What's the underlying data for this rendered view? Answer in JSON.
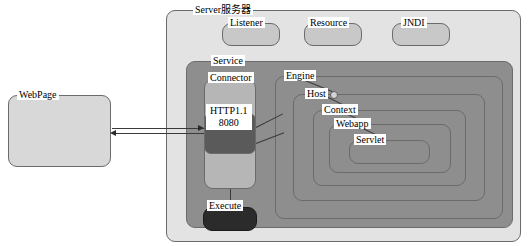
{
  "diagram": {
    "type": "architecture-block-diagram"
  },
  "colors": {
    "webpage_fill": "#d8d8d8",
    "server_fill": "#e3e3e3",
    "subbox_fill": "#c8c8c8",
    "service_fill": "#8e8e8e",
    "connector_fill": "#b6b6b6",
    "port_fill": "#5a5a5a",
    "execute_fill": "#2b2b2b",
    "border": "#6b6b6b",
    "line": "#3a3a3a"
  },
  "nodes": {
    "webpage": {
      "label": "WebPage"
    },
    "server": {
      "label": "Server服务器"
    },
    "listener": {
      "label": "Listener"
    },
    "resource": {
      "label": "Resource"
    },
    "jndi": {
      "label": "JNDI"
    },
    "service": {
      "label": "Service"
    },
    "connector": {
      "label": "Connector"
    },
    "port": {
      "protocol": "HTTP1.1",
      "number": "8080"
    },
    "execute": {
      "label": "Execute"
    },
    "engine": {
      "label": "Engine"
    },
    "host": {
      "label": "Host"
    },
    "context": {
      "label": "Context"
    },
    "webapp": {
      "label": "Webapp"
    },
    "servlet": {
      "label": "Servlet"
    }
  },
  "edges": [
    {
      "from": "connector",
      "to": "webpage",
      "direction": "left",
      "style": "solid"
    },
    {
      "from": "webpage",
      "to": "connector",
      "direction": "right",
      "style": "solid"
    },
    {
      "from": "connector",
      "to": "execute",
      "direction": "down",
      "style": "solid"
    },
    {
      "from": "connector",
      "to": "engine",
      "direction": "diagonal",
      "style": "solid"
    },
    {
      "from": "connector",
      "to": "engine-lower",
      "direction": "diagonal",
      "style": "solid"
    },
    {
      "from": "engine",
      "to": "host",
      "direction": "diagonal",
      "style": "solid"
    },
    {
      "from": "host",
      "to": "context",
      "direction": "diagonal",
      "style": "solid"
    },
    {
      "from": "context",
      "to": "webapp",
      "direction": "diagonal",
      "style": "solid"
    },
    {
      "from": "webapp",
      "to": "servlet",
      "direction": "diagonal",
      "style": "solid"
    }
  ]
}
